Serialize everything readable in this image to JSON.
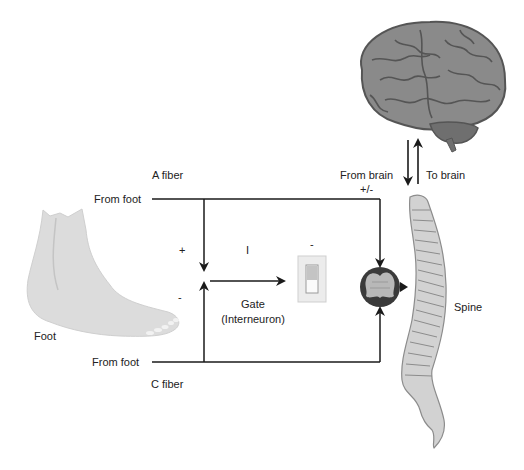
{
  "diagram": {
    "type": "gate-control-theory-of-pain",
    "labels": {
      "a_fiber": "A fiber",
      "c_fiber": "C fiber",
      "from_foot_top": "From foot",
      "from_foot_bottom": "From foot",
      "foot": "Foot",
      "from_brain": "From brain",
      "to_brain": "To brain",
      "brain_signal": "+/-",
      "plus": "+",
      "minus_left": "-",
      "inhibitory": "I",
      "gate_minus": "-",
      "gate": "Gate",
      "gate_sub": "(Interneuron)",
      "spine": "Spine"
    },
    "nodes": [
      {
        "id": "foot",
        "icon": "foot-icon"
      },
      {
        "id": "brain",
        "icon": "brain-icon"
      },
      {
        "id": "spine",
        "icon": "spine-icon"
      },
      {
        "id": "gate",
        "icon": "switch-icon"
      },
      {
        "id": "projection-neuron",
        "icon": "neuron-circle-icon"
      }
    ],
    "colors": {
      "line": "#1a1a1a",
      "foot": "#d9d9d9",
      "brain": "#8a8a8a",
      "brain_stroke": "#555555",
      "spine": "#cfcfcf",
      "spine_stroke": "#8c8c8c",
      "neuron_outer": "#3a3a3a",
      "neuron_inner": "#b8b8b8"
    }
  }
}
